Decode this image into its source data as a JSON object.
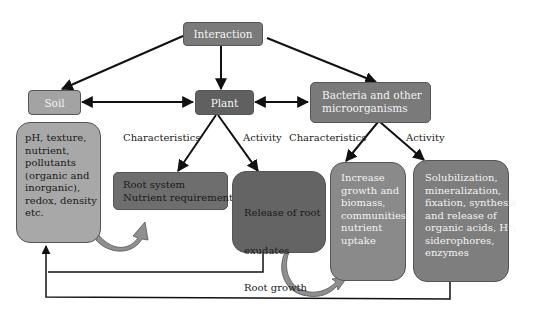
{
  "nodes": {
    "interaction": {
      "label": "Interaction",
      "fill": "#7a7a7a"
    },
    "soil": {
      "label": "Soil",
      "fill": "#a3a3a3"
    },
    "plant": {
      "label": "Plant",
      "fill": "#606060"
    },
    "bacteria": {
      "label_lines": [
        "Bacteria and other",
        "microorganisms"
      ],
      "fill": "#7a7a7a"
    },
    "soil_props": {
      "lines": [
        "pH, texture,",
        "nutrient,",
        "pollutants",
        "(organic and",
        "inorganic),",
        "redox, density",
        "etc."
      ],
      "fill": "#a8a8a8"
    },
    "plant_characteristics": {
      "lines": [
        "Root system",
        "Nutrient requirement"
      ],
      "fill": "#6e6e6e"
    },
    "plant_activity": {
      "lines": [
        "Release of root",
        "  exudates",
        "Root growth",
        "Nutrient uptake"
      ],
      "fill": "#646464"
    },
    "bacteria_characteristics": {
      "lines": [
        "Increase",
        "growth and",
        "biomass,",
        "communities,",
        "nutrient",
        "uptake"
      ],
      "fill": "#8a8a8a"
    },
    "bacteria_activity": {
      "lines": [
        "Solubilization,",
        "mineralization,",
        "fixation, synthesis",
        "and release of",
        "organic acids, H⁺,",
        "siderophores,",
        "enzymes"
      ],
      "fill": "#7e7e7e"
    }
  },
  "edge_labels": {
    "plant_characteristics": "Characteristics",
    "plant_activity": "Activity",
    "bacteria_characteristics": "Characteristics",
    "bacteria_activity": "Activity"
  }
}
